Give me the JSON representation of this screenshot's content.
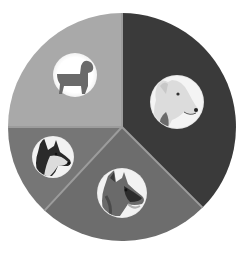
{
  "chart_data": {
    "type": "pie",
    "title": "",
    "start_angle_deg": 0,
    "direction": "clockwise",
    "center": [
      122,
      127
    ],
    "radius": 114,
    "divider_color": "#9c9c9c",
    "categories": [
      "White fluffy dog",
      "German Shepherd",
      "Husky",
      "Generic dog icon"
    ],
    "values": [
      37.5,
      24.4,
      13.1,
      25.0
    ],
    "colors": [
      "#3a3a3a",
      "#6d6d6d",
      "#767676",
      "#a9a9a9"
    ],
    "slices": [
      {
        "label": "White fluffy dog",
        "value": 37.5,
        "color": "#3a3a3a",
        "icon": "samoyed-photo-icon",
        "icon_center": [
          177,
          102
        ],
        "icon_r": 27
      },
      {
        "label": "German Shepherd",
        "value": 24.4,
        "color": "#6d6d6d",
        "icon": "german-shepherd-photo-icon",
        "icon_center": [
          122,
          193
        ],
        "icon_r": 25
      },
      {
        "label": "Husky",
        "value": 13.1,
        "color": "#767676",
        "icon": "husky-photo-icon",
        "icon_center": [
          53,
          157
        ],
        "icon_r": 21
      },
      {
        "label": "Generic dog icon",
        "value": 25.0,
        "color": "#a9a9a9",
        "icon": "dog-silhouette-icon",
        "icon_center": [
          75,
          75
        ],
        "icon_r": 22
      }
    ],
    "legend": null,
    "grid": false
  }
}
